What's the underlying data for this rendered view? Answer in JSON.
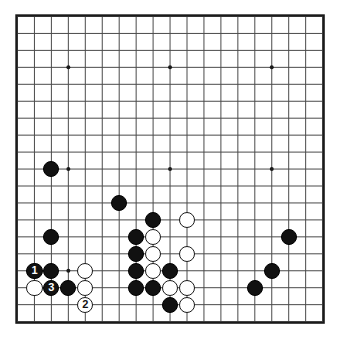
{
  "board": {
    "title": "Go board diagram",
    "size": 19,
    "colors": {
      "background": "#ffffff",
      "line": "#4a4a4a",
      "border": "#1a1a1a",
      "star_point": "#1a1a1a",
      "black_stone": "#111111",
      "white_stone": "#ffffff",
      "white_stone_outline": "#1a1a1a"
    },
    "geometry": {
      "origin_x": 17.5,
      "origin_y": 16.5,
      "spacing": 16.95,
      "stone_diameter": 16.2,
      "border_width": 2.2,
      "line_width": 1.0,
      "star_radius": 2.0
    },
    "star_points": [
      {
        "col": 3,
        "row": 3
      },
      {
        "col": 9,
        "row": 3
      },
      {
        "col": 15,
        "row": 3
      },
      {
        "col": 3,
        "row": 9
      },
      {
        "col": 9,
        "row": 9
      },
      {
        "col": 15,
        "row": 9
      },
      {
        "col": 3,
        "row": 15
      },
      {
        "col": 9,
        "row": 15
      },
      {
        "col": 15,
        "row": 15
      }
    ],
    "stones": [
      {
        "col": 2,
        "row": 9,
        "color": "black",
        "label": ""
      },
      {
        "col": 6,
        "row": 11,
        "color": "black",
        "label": ""
      },
      {
        "col": 8,
        "row": 12,
        "color": "black",
        "label": ""
      },
      {
        "col": 10,
        "row": 12,
        "color": "white",
        "label": ""
      },
      {
        "col": 2,
        "row": 13,
        "color": "black",
        "label": ""
      },
      {
        "col": 7,
        "row": 13,
        "color": "black",
        "label": ""
      },
      {
        "col": 8,
        "row": 13,
        "color": "white",
        "label": ""
      },
      {
        "col": 16,
        "row": 13,
        "color": "black",
        "label": ""
      },
      {
        "col": 7,
        "row": 14,
        "color": "black",
        "label": ""
      },
      {
        "col": 8,
        "row": 14,
        "color": "white",
        "label": ""
      },
      {
        "col": 10,
        "row": 14,
        "color": "white",
        "label": ""
      },
      {
        "col": 1,
        "row": 15,
        "color": "black",
        "label": "1"
      },
      {
        "col": 2,
        "row": 15,
        "color": "black",
        "label": ""
      },
      {
        "col": 4,
        "row": 15,
        "color": "white",
        "label": ""
      },
      {
        "col": 7,
        "row": 15,
        "color": "black",
        "label": ""
      },
      {
        "col": 8,
        "row": 15,
        "color": "white",
        "label": ""
      },
      {
        "col": 9,
        "row": 15,
        "color": "black",
        "label": ""
      },
      {
        "col": 15,
        "row": 15,
        "color": "black",
        "label": ""
      },
      {
        "col": 1,
        "row": 16,
        "color": "white",
        "label": ""
      },
      {
        "col": 2,
        "row": 16,
        "color": "black",
        "label": "3"
      },
      {
        "col": 3,
        "row": 16,
        "color": "black",
        "label": ""
      },
      {
        "col": 4,
        "row": 16,
        "color": "white",
        "label": ""
      },
      {
        "col": 7,
        "row": 16,
        "color": "black",
        "label": ""
      },
      {
        "col": 8,
        "row": 16,
        "color": "black",
        "label": ""
      },
      {
        "col": 9,
        "row": 16,
        "color": "white",
        "label": ""
      },
      {
        "col": 10,
        "row": 16,
        "color": "white",
        "label": ""
      },
      {
        "col": 14,
        "row": 16,
        "color": "black",
        "label": ""
      },
      {
        "col": 4,
        "row": 17,
        "color": "white",
        "label": "2"
      },
      {
        "col": 9,
        "row": 17,
        "color": "black",
        "label": ""
      },
      {
        "col": 10,
        "row": 17,
        "color": "white",
        "label": ""
      }
    ]
  }
}
